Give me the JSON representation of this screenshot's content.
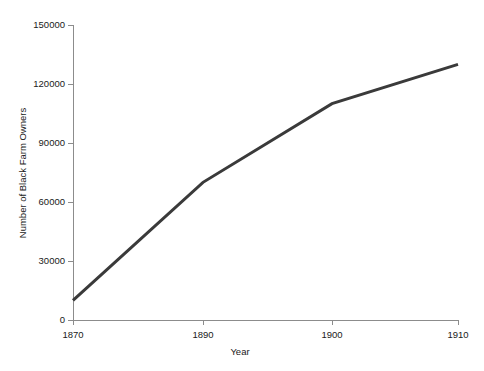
{
  "chart_data": {
    "type": "line",
    "title": "",
    "xlabel": "Year",
    "ylabel": "Number of Black Farm Owners",
    "x": [
      1870,
      1890,
      1900,
      1910
    ],
    "xtick_labels": [
      "1870",
      "1890",
      "1900",
      "1910"
    ],
    "values": [
      10000,
      70000,
      110000,
      130000
    ],
    "series": [
      {
        "name": "Black Farm Owners",
        "values": [
          10000,
          70000,
          110000,
          130000
        ]
      }
    ],
    "ytick_labels": [
      "0",
      "30000",
      "60000",
      "90000",
      "120000",
      "150000"
    ],
    "yticks": [
      0,
      30000,
      60000,
      90000,
      120000,
      150000
    ],
    "ylim": [
      0,
      150000
    ],
    "grid": false,
    "legend": false,
    "legend_position": "none",
    "line_color": "#3a3a3a",
    "line_width": 3,
    "axis_color": "#8c8c8c",
    "background_color": "#ffffff",
    "text_color": "#1a1a1a"
  },
  "geometry": {
    "plot_left": 73,
    "plot_right": 458,
    "plot_top": 25,
    "plot_bottom": 320,
    "x_pixels": [
      73,
      203,
      332,
      458
    ],
    "y_pixels": [
      320,
      261,
      203,
      144,
      85,
      25
    ]
  }
}
